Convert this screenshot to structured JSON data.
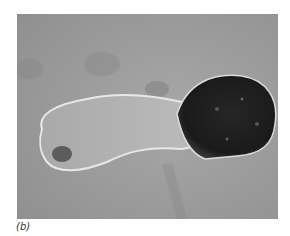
{
  "figure": {
    "panel_label": "(b)",
    "colors": {
      "background": "#9a9a9a",
      "cell_body": "#b4b4b4",
      "cell_head": "#1e1e1e",
      "outline": "#e6e6e6"
    }
  }
}
